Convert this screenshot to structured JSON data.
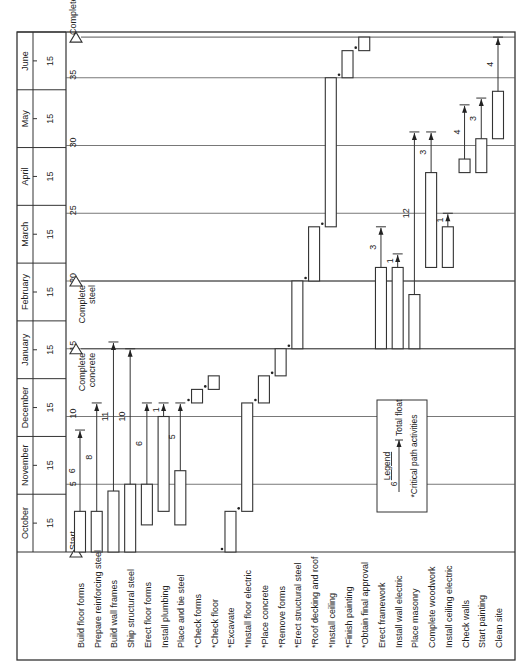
{
  "chart_data": {
    "type": "gantt",
    "title": "",
    "orientation": "rotated-90-ccw",
    "time_unit": "weeks",
    "xlim": [
      0,
      38
    ],
    "months": [
      {
        "label": "October",
        "tick": "15"
      },
      {
        "label": "November",
        "tick": "15"
      },
      {
        "label": "December",
        "tick": "15"
      },
      {
        "label": "January",
        "tick": "15"
      },
      {
        "label": "February",
        "tick": "15"
      },
      {
        "label": "March",
        "tick": "15"
      },
      {
        "label": "April",
        "tick": "15"
      },
      {
        "label": "May",
        "tick": "15"
      },
      {
        "label": "June",
        "tick": "15"
      }
    ],
    "week_ticks": [
      5,
      10,
      15,
      20,
      25,
      30,
      35
    ],
    "milestones": [
      {
        "label": "Start",
        "week": 0
      },
      {
        "label": "Complete concrete",
        "week": 15
      },
      {
        "label": "Complete steel",
        "week": 20
      },
      {
        "label": "Complete",
        "week": 38
      }
    ],
    "activities": [
      {
        "name": "Build floor forms",
        "critical": false,
        "start": 0,
        "end": 3,
        "float": 6
      },
      {
        "name": "Prepare reinforcing steel",
        "critical": false,
        "start": 0,
        "end": 3,
        "float": 8
      },
      {
        "name": "Build wall frames",
        "critical": false,
        "start": 0,
        "end": 4.5,
        "float": 11
      },
      {
        "name": "Ship structural steel",
        "critical": false,
        "start": 0,
        "end": 5,
        "float": 10
      },
      {
        "name": "Erect floor forms",
        "critical": false,
        "start": 2,
        "end": 5,
        "float": 6
      },
      {
        "name": "Install plumbing",
        "critical": false,
        "start": 3,
        "end": 10,
        "float": 1
      },
      {
        "name": "Place and tie steel",
        "critical": false,
        "start": 2,
        "end": 6,
        "float": 5
      },
      {
        "name": "Check forms",
        "critical": true,
        "start": 11,
        "end": 12,
        "float": null
      },
      {
        "name": "Check floor",
        "critical": true,
        "start": 12,
        "end": 13,
        "float": null
      },
      {
        "name": "Excavate",
        "critical": false,
        "start": 0,
        "end": 3,
        "float": null,
        "critical_mark": true
      },
      {
        "name": "Install floor electric",
        "critical": true,
        "start": 3,
        "end": 11,
        "float": null
      },
      {
        "name": "Place concrete",
        "critical": true,
        "start": 11,
        "end": 13,
        "float": null
      },
      {
        "name": "Remove forms",
        "critical": true,
        "start": 13,
        "end": 15,
        "float": null
      },
      {
        "name": "Erect structural steel",
        "critical": true,
        "start": 15,
        "end": 20,
        "float": null
      },
      {
        "name": "Roof decking and roof",
        "critical": true,
        "start": 20,
        "end": 24,
        "float": null
      },
      {
        "name": "Install ceiling",
        "critical": true,
        "start": 24,
        "end": 35,
        "float": null
      },
      {
        "name": "Finish painting",
        "critical": true,
        "start": 35,
        "end": 37,
        "float": null
      },
      {
        "name": "Obtain final approval",
        "critical": true,
        "start": 37,
        "end": 38,
        "float": null
      },
      {
        "name": "Erect framework",
        "critical": false,
        "start": 15,
        "end": 21,
        "float": 3
      },
      {
        "name": "Install wall electric",
        "critical": false,
        "start": 15,
        "end": 21,
        "float": 1
      },
      {
        "name": "Place masonry",
        "critical": false,
        "start": 15,
        "end": 19,
        "float": 12
      },
      {
        "name": "Complete woodwork",
        "critical": false,
        "start": 21,
        "end": 28,
        "float": 3
      },
      {
        "name": "Install ceiling electric",
        "critical": false,
        "start": 21,
        "end": 24,
        "float": 1
      },
      {
        "name": "Check walls",
        "critical": false,
        "start": 28,
        "end": 29,
        "float": 4
      },
      {
        "name": "Start painting",
        "critical": false,
        "start": 28,
        "end": 30.5,
        "float": 3
      },
      {
        "name": "Clean site",
        "critical": false,
        "start": 30.5,
        "end": 34,
        "float": 4
      }
    ],
    "activity_labels": [
      "Build floor forms",
      "Prepare reinforcing steel",
      "Build wall frames",
      "Ship structural steel",
      "Erect floor forms",
      "Install plumbing",
      "Place and tie steel",
      "*Check forms",
      "*Check floor",
      "*Excavate",
      "*Install floor electric",
      "*Place concrete",
      "*Remove forms",
      "*Erect structural steel",
      "*Roof decking and roof",
      "*Install ceiling",
      "*Finish painting",
      "*Obtain final approval",
      "Erect framework",
      "Install wall electric",
      "Place masonry",
      "Complete woodwork",
      "Install ceiling electric",
      "Check walls",
      "Start painting",
      "Clean site"
    ],
    "legend": {
      "title": "Legend",
      "float_example": "6",
      "float_label": "Total float",
      "critical_label": "*Critical path activities",
      "placement": "center-right"
    }
  }
}
